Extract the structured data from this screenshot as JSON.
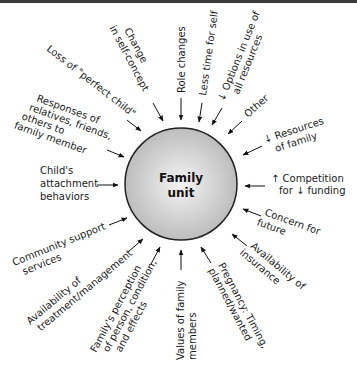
{
  "diagram": {
    "center": {
      "line1": "Family",
      "line2": "unit",
      "fill_inner": "#f4f4f4",
      "fill_outer": "#bdbdbd",
      "stroke": "#222222"
    },
    "factors": [
      {
        "id": "change-self-concept",
        "lines": [
          "Change",
          "in self-concept"
        ]
      },
      {
        "id": "role-changes",
        "lines": [
          "Role changes"
        ]
      },
      {
        "id": "less-time-self",
        "lines": [
          "Less time for self"
        ]
      },
      {
        "id": "options-resources",
        "lines": [
          "↓ Options in use of",
          "all resources"
        ]
      },
      {
        "id": "other",
        "lines": [
          "Other"
        ]
      },
      {
        "id": "resources-family",
        "lines": [
          "↓ Resources",
          "of family"
        ]
      },
      {
        "id": "competition-funding",
        "lines": [
          "↑ Competition",
          "for ↓ funding"
        ]
      },
      {
        "id": "concern-future",
        "lines": [
          "Concern for",
          "future"
        ]
      },
      {
        "id": "availability-insurance",
        "lines": [
          "Availability of",
          "insurance"
        ]
      },
      {
        "id": "pregnancy",
        "lines": [
          "Pregnancy: Timing,",
          "planned/wanted"
        ]
      },
      {
        "id": "values-family",
        "lines": [
          "Values of family",
          "members"
        ]
      },
      {
        "id": "family-perception",
        "lines": [
          "Family's perception",
          "of person, condition,",
          "and effects"
        ]
      },
      {
        "id": "availability-treatment",
        "lines": [
          "Availability of",
          "treatment/management"
        ]
      },
      {
        "id": "community-support",
        "lines": [
          "Community support",
          "services"
        ]
      },
      {
        "id": "attachment-behaviors",
        "lines": [
          "Child's",
          "attachment",
          "behaviors"
        ]
      },
      {
        "id": "responses-relatives",
        "lines": [
          "Responses of",
          "relatives, friends,",
          "others to",
          "family member"
        ]
      },
      {
        "id": "loss-perfect-child",
        "lines": [
          "Loss of \"perfect child\""
        ]
      }
    ]
  }
}
